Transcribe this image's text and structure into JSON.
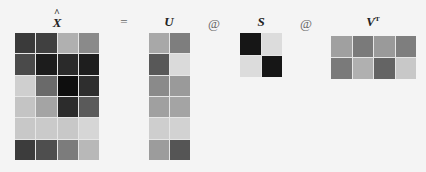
{
  "equation": {
    "operators": {
      "equals": "=",
      "matmul_1": "@",
      "matmul_2": "@"
    },
    "matrices": [
      {
        "id": "x_hat",
        "label": "X",
        "label_decoration": "hat",
        "rows": 6,
        "cols": 4,
        "cells": [
          [
            "#3a3a3a",
            "#404040",
            "#b0b0b0",
            "#8a8a8a"
          ],
          [
            "#4a4a4a",
            "#1c1c1c",
            "#2a2a2a",
            "#1e1e1e"
          ],
          [
            "#cfcfcf",
            "#6a6a6a",
            "#0e0e0e",
            "#2e2e2e"
          ],
          [
            "#c4c4c4",
            "#a4a4a4",
            "#2c2c2c",
            "#5a5a5a"
          ],
          [
            "#c8c8c8",
            "#cacaca",
            "#c8c8c8",
            "#d6d6d6"
          ],
          [
            "#3c3c3c",
            "#4e4e4e",
            "#7c7c7c",
            "#b8b8b8"
          ]
        ]
      },
      {
        "id": "u",
        "label": "U",
        "rows": 6,
        "cols": 2,
        "cells": [
          [
            "#a8a8a8",
            "#7e7e7e"
          ],
          [
            "#585858",
            "#dadada"
          ],
          [
            "#8a8a8a",
            "#9a9a9a"
          ],
          [
            "#a0a0a0",
            "#a4a4a4"
          ],
          [
            "#cecece",
            "#d2d2d2"
          ],
          [
            "#9c9c9c",
            "#555555"
          ]
        ]
      },
      {
        "id": "s",
        "label": "S",
        "rows": 2,
        "cols": 2,
        "cells": [
          [
            "#161616",
            "#dcdcdc"
          ],
          [
            "#dcdcdc",
            "#161616"
          ]
        ]
      },
      {
        "id": "vt",
        "label": "V",
        "label_superscript": "T",
        "rows": 2,
        "cols": 4,
        "cells": [
          [
            "#a0a0a0",
            "#7a7a7a",
            "#9a9a9a",
            "#7e7e7e"
          ],
          [
            "#7a7a7a",
            "#b0b0b0",
            "#646464",
            "#c8c8c8"
          ]
        ]
      }
    ]
  }
}
